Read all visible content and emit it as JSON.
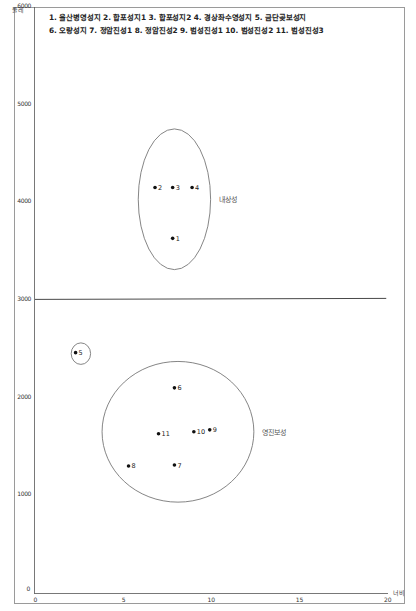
{
  "chart_data": {
    "type": "scatter",
    "title_lines": [
      "1. 울산병영성지 2. 합포성지1 3. 합포성지2 4. 경상좌수영성지 5. 금단곶보성지",
      "6. 오량성지 7. 정암진성1 8. 정암진성2 9. 범성진성1 10. 범성진성2 11. 범성진성3"
    ],
    "xlabel": "너비",
    "ylabel": "둘레",
    "xlim": [
      0,
      20
    ],
    "ylim": [
      0,
      6000
    ],
    "xticks": [
      "0",
      "5",
      "10",
      "15",
      "20"
    ],
    "yticks": [
      "0",
      "1000",
      "2000",
      "3000",
      "4000",
      "5000",
      "6000"
    ],
    "grid": false,
    "reference_line": {
      "y": 3000,
      "x_from": 0,
      "x_to": 19.9
    },
    "points": [
      {
        "id": "1",
        "name": "울산병영성지",
        "x": 7.8,
        "y": 3630
      },
      {
        "id": "2",
        "name": "합포성지1",
        "x": 6.8,
        "y": 4150
      },
      {
        "id": "3",
        "name": "합포성지2",
        "x": 7.8,
        "y": 4150
      },
      {
        "id": "4",
        "name": "경상좌수영성지",
        "x": 8.9,
        "y": 4150
      },
      {
        "id": "5",
        "name": "금단곶보성지",
        "x": 2.3,
        "y": 2460
      },
      {
        "id": "6",
        "name": "오량성지",
        "x": 7.9,
        "y": 2100
      },
      {
        "id": "7",
        "name": "정암진성1",
        "x": 7.9,
        "y": 1310
      },
      {
        "id": "8",
        "name": "정암진성2",
        "x": 5.3,
        "y": 1300
      },
      {
        "id": "9",
        "name": "범성진성1",
        "x": 9.9,
        "y": 1670
      },
      {
        "id": "10",
        "name": "범성진성2",
        "x": 9.0,
        "y": 1650
      },
      {
        "id": "11",
        "name": "범성진성3",
        "x": 7.0,
        "y": 1630
      }
    ],
    "groups": [
      {
        "label": "내상성",
        "members": [
          "1",
          "2",
          "3",
          "4"
        ],
        "cx": 7.9,
        "cy": 4030,
        "rx": 2.05,
        "ry": 720
      },
      {
        "label": "",
        "members": [
          "5"
        ],
        "cx": 2.6,
        "cy": 2450,
        "rx": 0.55,
        "ry": 110
      },
      {
        "label": "영진보성",
        "members": [
          "6",
          "7",
          "8",
          "9",
          "10",
          "11"
        ],
        "cx": 8.1,
        "cy": 1650,
        "rx": 4.3,
        "ry": 720
      }
    ]
  }
}
